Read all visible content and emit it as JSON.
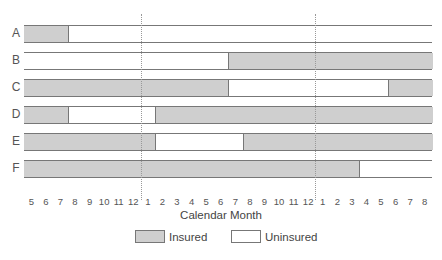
{
  "chart_data": {
    "type": "bar",
    "subtype": "horizontal-timeline",
    "title": "",
    "xlabel": "Calendar Month",
    "ylabel": "",
    "x_tick_labels": [
      "5",
      "6",
      "7",
      "8",
      "9",
      "10",
      "11",
      "12",
      "1",
      "2",
      "3",
      "4",
      "5",
      "6",
      "7",
      "8",
      "9",
      "10",
      "11",
      "12",
      "1",
      "2",
      "3",
      "4",
      "5",
      "6",
      "7",
      "8"
    ],
    "year_separators_after_index": [
      7,
      19
    ],
    "categories": [
      "A",
      "B",
      "C",
      "D",
      "E",
      "F"
    ],
    "series": [
      {
        "name": "A",
        "segments": [
          {
            "state": "Insured",
            "start": 0,
            "end": 3
          },
          {
            "state": "Uninsured",
            "start": 3,
            "end": 28
          }
        ]
      },
      {
        "name": "B",
        "segments": [
          {
            "state": "Uninsured",
            "start": 0,
            "end": 14
          },
          {
            "state": "Insured",
            "start": 14,
            "end": 28
          }
        ]
      },
      {
        "name": "C",
        "segments": [
          {
            "state": "Insured",
            "start": 0,
            "end": 14
          },
          {
            "state": "Uninsured",
            "start": 14,
            "end": 25
          },
          {
            "state": "Insured",
            "start": 25,
            "end": 28
          }
        ]
      },
      {
        "name": "D",
        "segments": [
          {
            "state": "Insured",
            "start": 0,
            "end": 3
          },
          {
            "state": "Uninsured",
            "start": 3,
            "end": 9
          },
          {
            "state": "Insured",
            "start": 9,
            "end": 28
          }
        ]
      },
      {
        "name": "E",
        "segments": [
          {
            "state": "Insured",
            "start": 0,
            "end": 9
          },
          {
            "state": "Uninsured",
            "start": 9,
            "end": 15
          },
          {
            "state": "Insured",
            "start": 15,
            "end": 28
          }
        ]
      },
      {
        "name": "F",
        "segments": [
          {
            "state": "Insured",
            "start": 0,
            "end": 23
          },
          {
            "state": "Uninsured",
            "start": 23,
            "end": 28
          }
        ]
      }
    ],
    "legend": [
      {
        "label": "Insured",
        "color": "#cfcfcf"
      },
      {
        "label": "Uninsured",
        "color": "#ffffff"
      }
    ],
    "legend_position": "bottom",
    "grid": false
  },
  "legend": {
    "insured": "Insured",
    "uninsured": "Uninsured"
  },
  "axis": {
    "x_title": "Calendar Month"
  },
  "colors": {
    "insured": "#cfcfcf",
    "uninsured": "#ffffff",
    "outline": "#777777"
  }
}
